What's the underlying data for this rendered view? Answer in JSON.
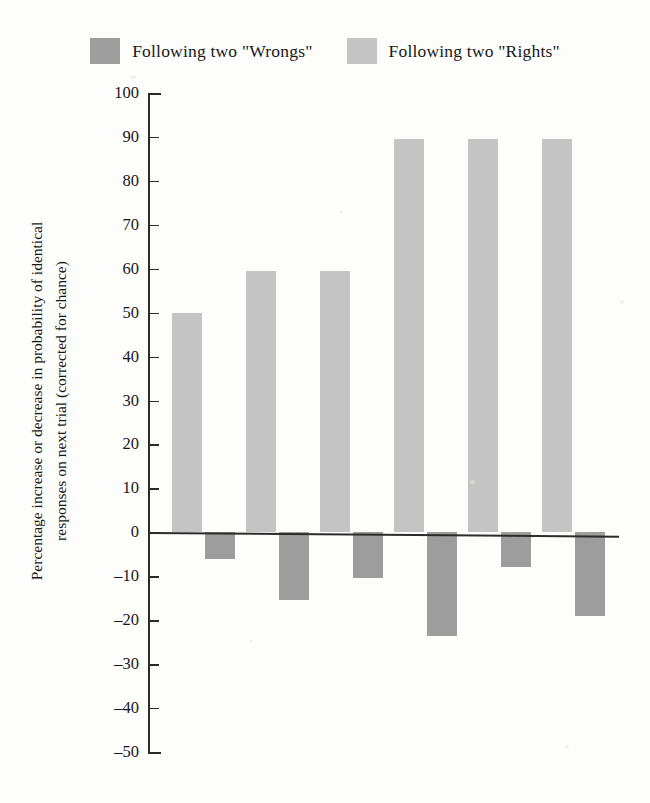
{
  "legend": {
    "items": [
      {
        "label": "Following two \"Wrongs\"",
        "color": "#9d9d9d",
        "swatch_name": "legend-swatch-wrongs"
      },
      {
        "label": "Following two \"Rights\"",
        "color": "#c4c4c4",
        "swatch_name": "legend-swatch-rights"
      }
    ]
  },
  "axis": {
    "title_line1": "Percentage increase or decrease in probability of identical",
    "title_line2": "responses on next trial (corrected for chance)",
    "ticks": [
      "100",
      "90",
      "80",
      "70",
      "60",
      "50",
      "40",
      "30",
      "20",
      "10",
      "0",
      "–10",
      "–20",
      "–30",
      "–40",
      "–50"
    ]
  },
  "chart_data": {
    "type": "bar",
    "title": "",
    "xlabel": "",
    "ylabel": "Percentage increase or decrease in probability of identical responses on next trial (corrected for chance)",
    "ylim": [
      -50,
      100
    ],
    "ytick_values": [
      100,
      90,
      80,
      70,
      60,
      50,
      40,
      30,
      20,
      10,
      0,
      -10,
      -20,
      -30,
      -40,
      -50
    ],
    "grid": false,
    "legend_position": "top-center",
    "categories": [
      "1",
      "2",
      "3",
      "4",
      "5",
      "6"
    ],
    "series": [
      {
        "name": "Following two \"Rights\"",
        "color": "#c4c4c4",
        "values": [
          50,
          59.5,
          59.5,
          89.5,
          89.5,
          89.5
        ]
      },
      {
        "name": "Following two \"Wrongs\"",
        "color": "#9d9d9d",
        "values": [
          -6,
          -15.5,
          -10.5,
          -23.5,
          -8,
          -19
        ]
      }
    ]
  }
}
